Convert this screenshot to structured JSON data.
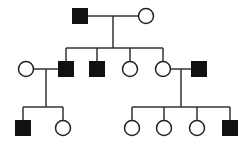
{
  "legend_colors": {
    "affected": "#111111",
    "unaffected": "#ffffff",
    "line": "#333333"
  },
  "individuals": [
    {
      "id": "I-1",
      "generation": 1,
      "sex": "male",
      "affected": true
    },
    {
      "id": "I-2",
      "generation": 1,
      "sex": "female",
      "affected": false
    },
    {
      "id": "II-spouse-1",
      "generation": 2,
      "sex": "female",
      "affected": false
    },
    {
      "id": "II-1",
      "generation": 2,
      "sex": "male",
      "affected": true
    },
    {
      "id": "II-2",
      "generation": 2,
      "sex": "male",
      "affected": true
    },
    {
      "id": "II-3",
      "generation": 2,
      "sex": "female",
      "affected": false
    },
    {
      "id": "II-4",
      "generation": 2,
      "sex": "female",
      "affected": false
    },
    {
      "id": "II-spouse-2",
      "generation": 2,
      "sex": "male",
      "affected": true
    },
    {
      "id": "III-1",
      "generation": 3,
      "sex": "male",
      "affected": true
    },
    {
      "id": "III-2",
      "generation": 3,
      "sex": "female",
      "affected": false
    },
    {
      "id": "III-3",
      "generation": 3,
      "sex": "female",
      "affected": false
    },
    {
      "id": "III-4",
      "generation": 3,
      "sex": "female",
      "affected": false
    },
    {
      "id": "III-5",
      "generation": 3,
      "sex": "female",
      "affected": false
    },
    {
      "id": "III-6",
      "generation": 3,
      "sex": "male",
      "affected": true
    }
  ],
  "matings": [
    {
      "partners": [
        "I-1",
        "I-2"
      ],
      "children": [
        "II-1",
        "II-2",
        "II-3",
        "II-4"
      ]
    },
    {
      "partners": [
        "II-spouse-1",
        "II-1"
      ],
      "children": [
        "III-1",
        "III-2"
      ]
    },
    {
      "partners": [
        "II-4",
        "II-spouse-2"
      ],
      "children": [
        "III-3",
        "III-4",
        "III-5",
        "III-6"
      ]
    }
  ]
}
